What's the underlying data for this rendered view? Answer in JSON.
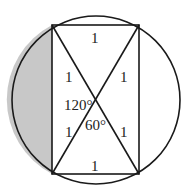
{
  "diagram": {
    "colors": {
      "stroke": "#1a1a1a",
      "shade": "#c8c8c8",
      "background": "#ffffff"
    },
    "circle": {
      "cx": 96,
      "cy": 100,
      "r": 84
    },
    "rectangle": {
      "x1": 52,
      "y1": 25,
      "x2": 139,
      "y2": 174
    },
    "labels": {
      "top_side": "1",
      "bottom_side": "1",
      "upper_left_half_diag": "1",
      "upper_right_half_diag": "1",
      "lower_left_half_diag": "1",
      "lower_right_half_diag": "1",
      "angle_left": "120°",
      "angle_bottom": "60°"
    }
  }
}
